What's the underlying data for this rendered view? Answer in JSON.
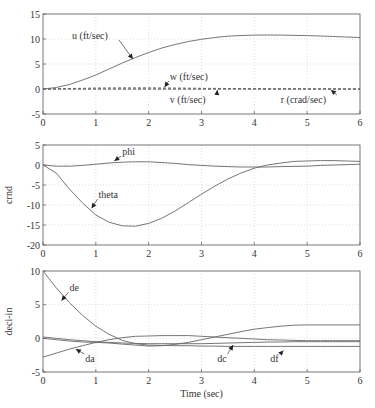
{
  "chart_data": [
    {
      "type": "line",
      "title": "",
      "xlabel": "",
      "ylabel": "",
      "xlim": [
        0,
        6
      ],
      "ylim": [
        -5,
        15
      ],
      "xticks": [
        0,
        1,
        2,
        3,
        4,
        5,
        6
      ],
      "yticks": [
        -5,
        0,
        5,
        10,
        15
      ],
      "grid": true,
      "x": [
        0,
        0.25,
        0.5,
        0.75,
        1,
        1.25,
        1.5,
        1.75,
        2,
        2.25,
        2.5,
        2.75,
        3,
        3.25,
        3.5,
        3.75,
        4,
        4.25,
        4.5,
        4.75,
        5,
        5.25,
        5.5,
        5.75,
        6
      ],
      "series": [
        {
          "name": "u (ft/sec)",
          "style": "solid",
          "values": [
            0,
            0.3,
            0.9,
            1.8,
            2.8,
            4.0,
            5.2,
            6.3,
            7.3,
            8.2,
            8.9,
            9.5,
            9.95,
            10.3,
            10.55,
            10.7,
            10.78,
            10.8,
            10.78,
            10.73,
            10.68,
            10.6,
            10.5,
            10.4,
            10.3
          ]
        },
        {
          "name": "w (ft/sec)",
          "style": "dashed",
          "values": [
            0,
            0.05,
            0.1,
            0.15,
            0.2,
            0.22,
            0.25,
            0.25,
            0.25,
            0.22,
            0.2,
            0.18,
            0.15,
            0.12,
            0.1,
            0.08,
            0.06,
            0.05,
            0.04,
            0.03,
            0.02,
            0.02,
            0.01,
            0.01,
            0.01
          ]
        },
        {
          "name": "v (ft/sec)",
          "style": "dashed",
          "values": [
            0,
            0,
            0,
            0,
            0,
            0,
            0,
            0,
            0,
            0,
            0,
            0,
            0,
            0,
            0,
            0,
            0,
            0,
            0,
            0,
            0,
            0,
            0,
            0,
            0
          ]
        },
        {
          "name": "r (crad/sec)",
          "style": "dashed",
          "values": [
            0,
            0,
            0,
            0,
            0,
            0,
            0,
            0,
            0,
            0,
            0,
            0,
            0,
            0,
            0,
            0,
            0,
            0,
            0,
            0,
            0,
            0,
            0,
            0,
            0
          ]
        }
      ],
      "annotations": [
        {
          "text": "u (ft/sec)",
          "tx": 0.55,
          "ty": 10.0,
          "ax": 1.7,
          "ay": 6.0
        },
        {
          "text": "w (ft/sec)",
          "tx": 2.4,
          "ty": 1.8,
          "ax": 2.3,
          "ay": 0.4
        },
        {
          "text": "v (ft/sec)",
          "tx": 2.4,
          "ty": -2.8,
          "ax": 3.3,
          "ay": -0.2
        },
        {
          "text": "r (crad/sec)",
          "tx": 4.5,
          "ty": -2.8,
          "ax": 5.45,
          "ay": -0.2
        }
      ]
    },
    {
      "type": "line",
      "title": "",
      "xlabel": "",
      "ylabel": "crnd",
      "xlim": [
        0,
        6
      ],
      "ylim": [
        -20,
        5
      ],
      "xticks": [
        0,
        1,
        2,
        3,
        4,
        5,
        6
      ],
      "yticks": [
        -20,
        -15,
        -10,
        -5,
        0,
        5
      ],
      "grid": true,
      "x": [
        0,
        0.25,
        0.5,
        0.75,
        1,
        1.25,
        1.5,
        1.75,
        2,
        2.25,
        2.5,
        2.75,
        3,
        3.25,
        3.5,
        3.75,
        4,
        4.25,
        4.5,
        4.75,
        5,
        5.25,
        5.5,
        5.75,
        6
      ],
      "series": [
        {
          "name": "phi",
          "style": "solid",
          "values": [
            0,
            -0.3,
            -0.3,
            -0.1,
            0.2,
            0.5,
            0.7,
            0.8,
            0.8,
            0.6,
            0.4,
            0.1,
            -0.1,
            -0.3,
            -0.4,
            -0.5,
            -0.5,
            -0.5,
            -0.4,
            -0.35,
            -0.3,
            -0.1,
            0,
            0.1,
            0.2
          ]
        },
        {
          "name": "theta",
          "style": "solid",
          "values": [
            0,
            -2.0,
            -6.0,
            -9.5,
            -12.5,
            -14.3,
            -15.2,
            -15.3,
            -14.6,
            -13.3,
            -11.5,
            -9.4,
            -7.3,
            -5.3,
            -3.5,
            -2.0,
            -0.8,
            0.0,
            0.5,
            0.9,
            1.0,
            1.1,
            1.1,
            1.0,
            0.9
          ]
        }
      ],
      "annotations": [
        {
          "text": "phi",
          "tx": 1.5,
          "ty": 2.5,
          "ax": 1.35,
          "ay": 1.0
        },
        {
          "text": "theta",
          "tx": 1.05,
          "ty": -8.3,
          "ax": 0.92,
          "ay": -10.8
        }
      ]
    },
    {
      "type": "line",
      "title": "",
      "xlabel": "Time (sec)",
      "ylabel": "deci-in",
      "xlim": [
        0,
        6
      ],
      "ylim": [
        -5,
        10
      ],
      "xticks": [
        0,
        1,
        2,
        3,
        4,
        5,
        6
      ],
      "yticks": [
        -5,
        0,
        5,
        10
      ],
      "grid": true,
      "x": [
        0,
        0.25,
        0.5,
        0.75,
        1,
        1.25,
        1.5,
        1.75,
        2,
        2.25,
        2.5,
        2.75,
        3,
        3.25,
        3.5,
        3.75,
        4,
        4.25,
        4.5,
        4.75,
        5,
        5.25,
        5.5,
        5.75,
        6
      ],
      "series": [
        {
          "name": "de",
          "style": "solid",
          "values": [
            10,
            7.5,
            5.3,
            3.4,
            1.8,
            0.6,
            -0.3,
            -0.8,
            -1.0,
            -1.05,
            -1.1,
            -1.1,
            -1.15,
            -1.15,
            -1.2,
            -1.2,
            -1.2,
            -1.2,
            -1.2,
            -1.2,
            -1.2,
            -1.2,
            -1.2,
            -1.2,
            -1.2
          ]
        },
        {
          "name": "da",
          "style": "solid",
          "values": [
            -2.8,
            -2.2,
            -1.6,
            -1.1,
            -0.6,
            -0.2,
            0.1,
            0.3,
            0.35,
            0.4,
            0.4,
            0.4,
            0.3,
            0.2,
            0.1,
            0,
            -0.1,
            -0.2,
            -0.25,
            -0.3,
            -0.35,
            -0.35,
            -0.35,
            -0.35,
            -0.35
          ]
        },
        {
          "name": "dc",
          "style": "solid",
          "values": [
            0.2,
            0,
            -0.2,
            -0.35,
            -0.5,
            -0.6,
            -0.7,
            -0.75,
            -0.8,
            -0.8,
            -0.8,
            -0.8,
            -0.8,
            -0.75,
            -0.7,
            -0.65,
            -0.6,
            -0.55,
            -0.55,
            -0.5,
            -0.5,
            -0.5,
            -0.5,
            -0.5,
            -0.5
          ]
        },
        {
          "name": "df",
          "style": "solid",
          "values": [
            0,
            -0.2,
            -0.4,
            -0.55,
            -0.6,
            -0.7,
            -0.85,
            -1.0,
            -1.15,
            -1.1,
            -0.9,
            -0.6,
            -0.2,
            0.2,
            0.6,
            1.0,
            1.35,
            1.6,
            1.8,
            1.95,
            2.0,
            2.0,
            2.0,
            2.0,
            2.0
          ]
        }
      ],
      "annotations": [
        {
          "text": "de",
          "tx": 0.5,
          "ty": 7.0,
          "ax": 0.35,
          "ay": 5.6
        },
        {
          "text": "da",
          "tx": 0.8,
          "ty": -3.5,
          "ax": 0.62,
          "ay": -1.6
        },
        {
          "text": "dc",
          "tx": 3.3,
          "ty": -3.5,
          "ax": 3.6,
          "ay": -1.0
        },
        {
          "text": "df",
          "tx": 4.3,
          "ty": -3.5,
          "ax": 4.55,
          "ay": -1.8
        }
      ]
    }
  ]
}
